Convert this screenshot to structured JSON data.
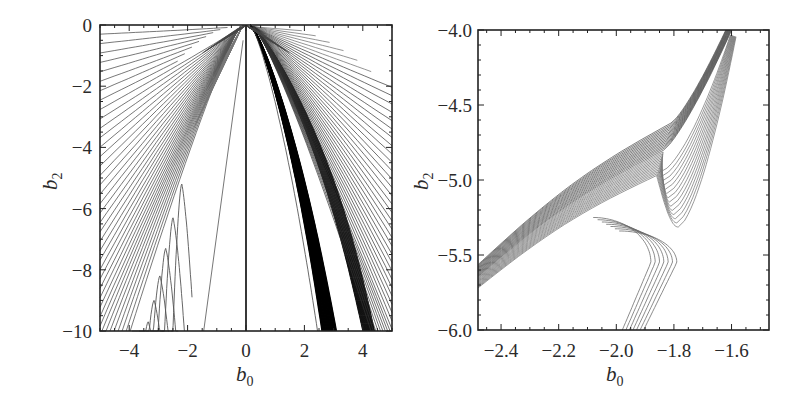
{
  "chart_data": [
    {
      "type": "line",
      "subtype": "contour",
      "panel": "left",
      "title": "",
      "xlabel": "b0",
      "ylabel": "b2",
      "xlim": [
        -5,
        5
      ],
      "ylim": [
        -10,
        0
      ],
      "xticks": [
        -4,
        -2,
        0,
        2,
        4
      ],
      "xtick_labels": [
        "−4",
        "−2",
        "0",
        "2",
        "4"
      ],
      "yticks": [
        0,
        -2,
        -4,
        -6,
        -8,
        -10
      ],
      "ytick_labels": [
        "0",
        "−2",
        "−4",
        "−6",
        "−8",
        "−10"
      ],
      "grid": false,
      "legend": null,
      "features": {
        "vertical_line_at_b0": 0,
        "left_fan_line_count": 40,
        "right_fan_line_count": 45,
        "dense_band_right": {
          "b0_at_top": 0.2,
          "b0_at_bottom": [
            2.6,
            3.1
          ]
        },
        "outer_band_right": {
          "b0_at_bottom": [
            4.0,
            4.4
          ]
        },
        "isolated_line_left": {
          "from": [
            -0.1,
            -0.5
          ],
          "to": [
            -1.45,
            -10
          ]
        },
        "closed_loops_left": [
          {
            "apex_b0": -2.05,
            "apex_b2": -5.2
          },
          {
            "apex_b0": -2.35,
            "apex_b2": -6.3
          },
          {
            "apex_b0": -2.6,
            "apex_b2": -7.3
          },
          {
            "apex_b0": -2.8,
            "apex_b2": -8.2
          },
          {
            "apex_b0": -3.0,
            "apex_b2": -9.0
          },
          {
            "apex_b0": -3.2,
            "apex_b2": -9.7
          }
        ]
      }
    },
    {
      "type": "line",
      "subtype": "contour",
      "panel": "right",
      "title": "",
      "xlabel": "b0",
      "ylabel": "b2",
      "xlim": [
        -2.48,
        -1.47
      ],
      "ylim": [
        -6.0,
        -4.0
      ],
      "xticks": [
        -2.4,
        -2.2,
        -2.0,
        -1.8,
        -1.6
      ],
      "xtick_labels": [
        "−2.4",
        "−2.2",
        "−2.0",
        "−1.8",
        "−1.6"
      ],
      "yticks": [
        -4.0,
        -4.5,
        -5.0,
        -5.5,
        -6.0
      ],
      "ytick_labels": [
        "−4.0",
        "−4.5",
        "−5.0",
        "−5.5",
        "−6.0"
      ],
      "grid": false,
      "legend": null,
      "features": {
        "band_line_count": 30,
        "band_left_entry_b2": [
          -5.6,
          -5.75
        ],
        "band_top_exit_b0": [
          -1.62,
          -1.58
        ],
        "knee_b0": -1.82,
        "deepest_dip": {
          "b0": -1.83,
          "b2": -5.3
        },
        "bottom_exit_b0": [
          -1.99,
          -1.92
        ],
        "dip_curve_count": 14
      }
    }
  ],
  "panels": {
    "left": {
      "xlabel": "b",
      "xlabel_sub": "0",
      "ylabel": "b",
      "ylabel_sub": "2"
    },
    "right": {
      "xlabel": "b",
      "xlabel_sub": "0",
      "ylabel": "b",
      "ylabel_sub": "2"
    }
  }
}
